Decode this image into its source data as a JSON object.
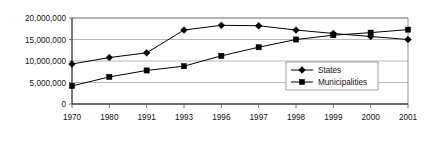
{
  "chart_data": {
    "type": "line",
    "title": "",
    "xlabel": "",
    "ylabel": "",
    "categories": [
      "1970",
      "1980",
      "1991",
      "1993",
      "1996",
      "1997",
      "1998",
      "1999",
      "2000",
      "2001"
    ],
    "series": [
      {
        "name": "States",
        "marker": "diamond",
        "color": "#000000",
        "values": [
          9300000,
          10800000,
          11900000,
          17200000,
          18300000,
          18200000,
          17200000,
          16400000,
          15700000,
          15000000
        ]
      },
      {
        "name": "Municipalities",
        "marker": "square",
        "color": "#000000",
        "values": [
          4200000,
          6300000,
          7800000,
          8800000,
          11200000,
          13200000,
          15000000,
          16000000,
          16600000,
          17300000
        ]
      }
    ],
    "ylim": [
      0,
      20000000
    ],
    "ytick_values": [
      0,
      5000000,
      10000000,
      15000000,
      20000000
    ],
    "ytick_labels": [
      "0",
      "5,000,000",
      "10,000,000",
      "15,000,000",
      "20,000,000"
    ],
    "grid": true,
    "legend_position": "inside-bottom-right",
    "legend_entries": [
      "States",
      "Municipalities"
    ]
  },
  "legend": {
    "items": [
      {
        "label": "States",
        "marker": "diamond-marker-icon"
      },
      {
        "label": "Municipalities",
        "marker": "square-marker-icon"
      }
    ]
  }
}
